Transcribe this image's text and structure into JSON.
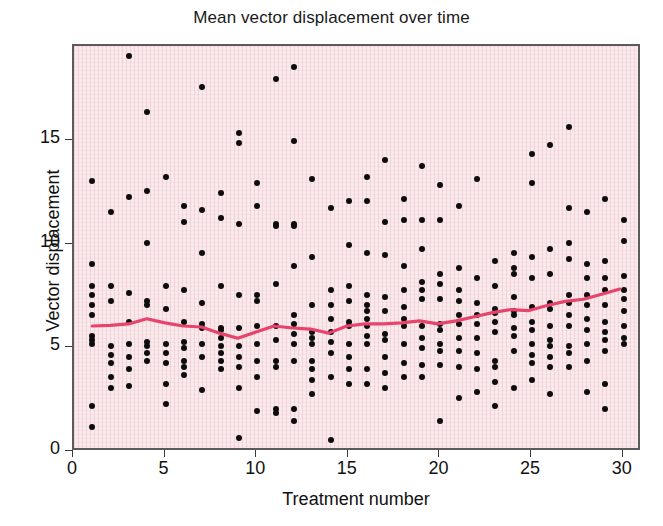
{
  "chart_data": {
    "type": "scatter",
    "title": "Mean vector displacement over time",
    "xlabel": "Treatment number",
    "ylabel": "Vector displacement",
    "xlim": [
      0,
      31
    ],
    "ylim": [
      0,
      19.6
    ],
    "xticks": [
      0,
      5,
      10,
      15,
      20,
      25,
      30
    ],
    "yticks": [
      0,
      5,
      10,
      15
    ],
    "grid": true,
    "grid_style": "fine vertical and horizontal ruling on pink background",
    "legend": "none",
    "plot_background_color": "#faeaec",
    "point_color": "#0d0d0d",
    "trend_line_color": "#e8436b",
    "series": [
      {
        "name": "Vector displacement observations",
        "type": "scatter",
        "points": [
          [
            1,
            13.1
          ],
          [
            1,
            9.1
          ],
          [
            1,
            8.0
          ],
          [
            1,
            7.6
          ],
          [
            1,
            7.1
          ],
          [
            1,
            6.6
          ],
          [
            1,
            5.6
          ],
          [
            1,
            5.4
          ],
          [
            1,
            5.2
          ],
          [
            1,
            2.2
          ],
          [
            1,
            1.2
          ],
          [
            2,
            11.6
          ],
          [
            2,
            8.0
          ],
          [
            2,
            7.3
          ],
          [
            2,
            5.1
          ],
          [
            2,
            4.7
          ],
          [
            2,
            4.3
          ],
          [
            2,
            3.6
          ],
          [
            2,
            3.1
          ],
          [
            3,
            19.1
          ],
          [
            3,
            12.3
          ],
          [
            3,
            7.7
          ],
          [
            3,
            6.3
          ],
          [
            3,
            5.2
          ],
          [
            3,
            4.6
          ],
          [
            3,
            4.0
          ],
          [
            3,
            3.2
          ],
          [
            4,
            16.4
          ],
          [
            4,
            12.6
          ],
          [
            4,
            10.1
          ],
          [
            4,
            7.3
          ],
          [
            4,
            7.1
          ],
          [
            4,
            5.3
          ],
          [
            4,
            5.1
          ],
          [
            4,
            4.8
          ],
          [
            4,
            4.4
          ],
          [
            5,
            13.3
          ],
          [
            5,
            8.0
          ],
          [
            5,
            6.9
          ],
          [
            5,
            5.2
          ],
          [
            5,
            4.8
          ],
          [
            5,
            4.3
          ],
          [
            5,
            3.3
          ],
          [
            5,
            2.3
          ],
          [
            6,
            11.9
          ],
          [
            6,
            11.1
          ],
          [
            6,
            7.8
          ],
          [
            6,
            6.3
          ],
          [
            6,
            5.3
          ],
          [
            6,
            5.0
          ],
          [
            6,
            4.4
          ],
          [
            6,
            4.1
          ],
          [
            6,
            3.7
          ],
          [
            7,
            17.6
          ],
          [
            7,
            11.7
          ],
          [
            7,
            9.6
          ],
          [
            7,
            7.2
          ],
          [
            7,
            6.2
          ],
          [
            7,
            6.0
          ],
          [
            7,
            5.2
          ],
          [
            7,
            4.6
          ],
          [
            7,
            3.0
          ],
          [
            8,
            12.5
          ],
          [
            8,
            11.3
          ],
          [
            8,
            8.0
          ],
          [
            8,
            6.0
          ],
          [
            8,
            5.9
          ],
          [
            8,
            5.5
          ],
          [
            8,
            5.1
          ],
          [
            8,
            4.8
          ],
          [
            8,
            4.4
          ],
          [
            8,
            4.0
          ],
          [
            9,
            15.4
          ],
          [
            9,
            14.9
          ],
          [
            9,
            11.0
          ],
          [
            9,
            7.6
          ],
          [
            9,
            6.0
          ],
          [
            9,
            5.1
          ],
          [
            9,
            4.6
          ],
          [
            9,
            4.1
          ],
          [
            9,
            3.1
          ],
          [
            9,
            0.7
          ],
          [
            10,
            13.0
          ],
          [
            10,
            11.9
          ],
          [
            10,
            7.6
          ],
          [
            10,
            7.3
          ],
          [
            10,
            6.1
          ],
          [
            10,
            5.2
          ],
          [
            10,
            4.4
          ],
          [
            10,
            3.6
          ],
          [
            10,
            2.0
          ],
          [
            11,
            18.0
          ],
          [
            11,
            11.0
          ],
          [
            11,
            10.9
          ],
          [
            11,
            8.1
          ],
          [
            11,
            6.1
          ],
          [
            11,
            5.4
          ],
          [
            11,
            4.4
          ],
          [
            11,
            4.1
          ],
          [
            11,
            2.1
          ],
          [
            11,
            1.9
          ],
          [
            12,
            18.6
          ],
          [
            12,
            15.0
          ],
          [
            12,
            11.0
          ],
          [
            12,
            10.9
          ],
          [
            12,
            9.0
          ],
          [
            12,
            6.6
          ],
          [
            12,
            6.2
          ],
          [
            12,
            5.7
          ],
          [
            12,
            5.2
          ],
          [
            12,
            4.4
          ],
          [
            12,
            2.1
          ],
          [
            12,
            1.5
          ],
          [
            13,
            13.2
          ],
          [
            13,
            9.4
          ],
          [
            13,
            7.1
          ],
          [
            13,
            5.8
          ],
          [
            13,
            5.5
          ],
          [
            13,
            5.2
          ],
          [
            13,
            4.4
          ],
          [
            13,
            4.0
          ],
          [
            13,
            3.5
          ],
          [
            13,
            2.8
          ],
          [
            14,
            11.8
          ],
          [
            14,
            7.8
          ],
          [
            14,
            7.1
          ],
          [
            14,
            6.4
          ],
          [
            14,
            5.8
          ],
          [
            14,
            5.3
          ],
          [
            14,
            4.8
          ],
          [
            14,
            3.6
          ],
          [
            14,
            0.6
          ],
          [
            15,
            12.1
          ],
          [
            15,
            10.0
          ],
          [
            15,
            8.0
          ],
          [
            15,
            7.3
          ],
          [
            15,
            6.3
          ],
          [
            15,
            6.1
          ],
          [
            15,
            5.2
          ],
          [
            15,
            4.6
          ],
          [
            15,
            4.0
          ],
          [
            15,
            3.3
          ],
          [
            16,
            13.3
          ],
          [
            16,
            12.1
          ],
          [
            16,
            9.6
          ],
          [
            16,
            7.6
          ],
          [
            16,
            7.1
          ],
          [
            16,
            6.8
          ],
          [
            16,
            6.4
          ],
          [
            16,
            6.1
          ],
          [
            16,
            5.6
          ],
          [
            16,
            5.2
          ],
          [
            16,
            4.0
          ],
          [
            16,
            3.3
          ],
          [
            17,
            14.1
          ],
          [
            17,
            11.1
          ],
          [
            17,
            9.5
          ],
          [
            17,
            7.5
          ],
          [
            17,
            6.8
          ],
          [
            17,
            5.7
          ],
          [
            17,
            5.4
          ],
          [
            17,
            4.6
          ],
          [
            17,
            3.8
          ],
          [
            17,
            3.1
          ],
          [
            18,
            12.2
          ],
          [
            18,
            11.2
          ],
          [
            18,
            9.0
          ],
          [
            18,
            7.8
          ],
          [
            18,
            7.0
          ],
          [
            18,
            6.4
          ],
          [
            18,
            6.1
          ],
          [
            18,
            5.2
          ],
          [
            18,
            4.3
          ],
          [
            18,
            3.6
          ],
          [
            19,
            13.8
          ],
          [
            19,
            11.2
          ],
          [
            19,
            9.8
          ],
          [
            19,
            8.2
          ],
          [
            19,
            7.8
          ],
          [
            19,
            7.4
          ],
          [
            19,
            6.1
          ],
          [
            19,
            5.5
          ],
          [
            19,
            5.0
          ],
          [
            19,
            4.2
          ],
          [
            19,
            3.6
          ],
          [
            20,
            12.9
          ],
          [
            20,
            11.2
          ],
          [
            20,
            8.6
          ],
          [
            20,
            8.1
          ],
          [
            20,
            7.4
          ],
          [
            20,
            6.2
          ],
          [
            20,
            5.9
          ],
          [
            20,
            5.2
          ],
          [
            20,
            4.9
          ],
          [
            20,
            4.2
          ],
          [
            20,
            1.5
          ],
          [
            21,
            11.9
          ],
          [
            21,
            8.9
          ],
          [
            21,
            7.8
          ],
          [
            21,
            7.3
          ],
          [
            21,
            6.6
          ],
          [
            21,
            6.2
          ],
          [
            21,
            5.5
          ],
          [
            21,
            4.9
          ],
          [
            21,
            4.1
          ],
          [
            21,
            2.6
          ],
          [
            22,
            13.2
          ],
          [
            22,
            8.4
          ],
          [
            22,
            7.2
          ],
          [
            22,
            6.6
          ],
          [
            22,
            6.2
          ],
          [
            22,
            5.5
          ],
          [
            22,
            4.8
          ],
          [
            22,
            4.0
          ],
          [
            22,
            2.9
          ],
          [
            23,
            9.2
          ],
          [
            23,
            8.0
          ],
          [
            23,
            6.9
          ],
          [
            23,
            6.7
          ],
          [
            23,
            6.3
          ],
          [
            23,
            5.8
          ],
          [
            23,
            4.4
          ],
          [
            23,
            4.1
          ],
          [
            23,
            3.4
          ],
          [
            23,
            2.2
          ],
          [
            24,
            9.6
          ],
          [
            24,
            8.9
          ],
          [
            24,
            8.6
          ],
          [
            24,
            7.5
          ],
          [
            24,
            6.8
          ],
          [
            24,
            6.6
          ],
          [
            24,
            6.0
          ],
          [
            24,
            5.6
          ],
          [
            24,
            4.9
          ],
          [
            24,
            3.1
          ],
          [
            25,
            14.4
          ],
          [
            25,
            13.0
          ],
          [
            25,
            9.4
          ],
          [
            25,
            8.4
          ],
          [
            25,
            7.0
          ],
          [
            25,
            6.3
          ],
          [
            25,
            5.9
          ],
          [
            25,
            5.2
          ],
          [
            25,
            4.7
          ],
          [
            25,
            4.3
          ],
          [
            25,
            3.5
          ],
          [
            26,
            14.8
          ],
          [
            26,
            9.8
          ],
          [
            26,
            8.6
          ],
          [
            26,
            7.2
          ],
          [
            26,
            6.9
          ],
          [
            26,
            6.1
          ],
          [
            26,
            5.4
          ],
          [
            26,
            5.1
          ],
          [
            26,
            4.6
          ],
          [
            26,
            4.1
          ],
          [
            26,
            2.8
          ],
          [
            27,
            15.7
          ],
          [
            27,
            11.8
          ],
          [
            27,
            10.1
          ],
          [
            27,
            9.3
          ],
          [
            27,
            7.6
          ],
          [
            27,
            7.2
          ],
          [
            27,
            6.6
          ],
          [
            27,
            6.1
          ],
          [
            27,
            5.1
          ],
          [
            27,
            4.8
          ],
          [
            27,
            4.1
          ],
          [
            28,
            11.6
          ],
          [
            28,
            9.1
          ],
          [
            28,
            8.4
          ],
          [
            28,
            7.6
          ],
          [
            28,
            7.1
          ],
          [
            28,
            6.4
          ],
          [
            28,
            5.9
          ],
          [
            28,
            5.2
          ],
          [
            28,
            4.4
          ],
          [
            28,
            2.9
          ],
          [
            29,
            12.2
          ],
          [
            29,
            9.2
          ],
          [
            29,
            8.4
          ],
          [
            29,
            7.8
          ],
          [
            29,
            7.1
          ],
          [
            29,
            6.3
          ],
          [
            29,
            5.8
          ],
          [
            29,
            5.4
          ],
          [
            29,
            4.9
          ],
          [
            29,
            3.3
          ],
          [
            29,
            2.1
          ],
          [
            30,
            11.2
          ],
          [
            30,
            10.2
          ],
          [
            30,
            8.5
          ],
          [
            30,
            7.8
          ],
          [
            30,
            7.4
          ],
          [
            30,
            6.8
          ],
          [
            30,
            6.1
          ],
          [
            30,
            5.5
          ],
          [
            30,
            5.2
          ]
        ]
      },
      {
        "name": "Mean trend line",
        "type": "line",
        "color": "#e8436b",
        "x": [
          1,
          2,
          3,
          4,
          5,
          6,
          7,
          8,
          9,
          10,
          11,
          12,
          13,
          14,
          15,
          16,
          17,
          18,
          19,
          20,
          21,
          22,
          23,
          24,
          25,
          26,
          27,
          28,
          29,
          30
        ],
        "values": [
          5.95,
          5.98,
          6.05,
          6.3,
          6.1,
          5.95,
          5.9,
          5.6,
          5.35,
          5.65,
          5.95,
          5.85,
          5.8,
          5.6,
          5.95,
          6.05,
          6.05,
          6.1,
          6.2,
          6.05,
          6.2,
          6.4,
          6.6,
          6.75,
          6.7,
          6.95,
          7.15,
          7.25,
          7.5,
          7.75
        ]
      }
    ]
  },
  "axes": {
    "x_tick_labels": [
      "0",
      "5",
      "10",
      "15",
      "20",
      "25",
      "30"
    ],
    "y_tick_labels": [
      "0",
      "5",
      "10",
      "15"
    ]
  }
}
